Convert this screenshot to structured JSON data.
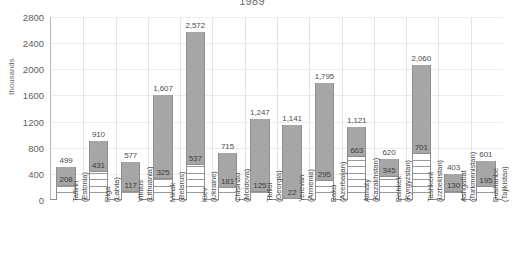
{
  "chart_data": {
    "type": "bar",
    "title": "1989",
    "xlabel": "",
    "ylabel": "thousands",
    "ylim": [
      0,
      2800
    ],
    "ytick_step": 400,
    "yticks": [
      0,
      400,
      800,
      1200,
      1600,
      2000,
      2400,
      2800
    ],
    "grid": true,
    "legend": "none",
    "bar_color": "#a6a6a6",
    "categories": [
      "Tallinn (Estonia)",
      "Riga (Latvia)",
      "Vilnius (Lithuania)",
      "Minsk (Belarus)",
      "Kiev (Ukraine)",
      "Chișinău (Moldova)",
      "Tbilisi (Georgia)",
      "Yerevan (Armenia)",
      "Baku (Azerbaijan)",
      "Almaty (Kazakhstan)",
      "Bishkek (Kyrgyzstan)",
      "Tashkent (Uzbekistan)",
      "Ashgabat (Turkmenistan)",
      "Dushanbe (Tajikistan)"
    ],
    "cities": [
      "Tallinn",
      "Riga",
      "Vilnius",
      "Minsk",
      "Kiev",
      "Chișinău",
      "Tbilisi",
      "Yerevan",
      "Baku",
      "Almaty",
      "Bishkek",
      "Tashkent",
      "Ashgabat",
      "Dushanbe"
    ],
    "countries": [
      "(Estonia)",
      "(Latvia)",
      "(Lithuania)",
      "(Belarus)",
      "(Ukraine)",
      "(Moldova)",
      "(Georgia)",
      "(Armenia)",
      "(Azerbaijan)",
      "(Kazakhstan)",
      "(Kyrgyzstan)",
      "(Uzbekistan)",
      "(Turkmenistan)",
      "(Tajikistan)"
    ],
    "series": [
      {
        "name": "total",
        "values": [
          499,
          910,
          577,
          1607,
          2572,
          715,
          1247,
          1141,
          1795,
          1121,
          620,
          2060,
          403,
          601
        ],
        "labels": [
          "499",
          "910",
          "577",
          "1,607",
          "2,572",
          "715",
          "1,247",
          "1,141",
          "1,795",
          "1,121",
          "620",
          "2,060",
          "403",
          "601"
        ]
      },
      {
        "name": "inner",
        "values": [
          208,
          431,
          117,
          325,
          537,
          181,
          125,
          22,
          295,
          663,
          345,
          701,
          130,
          195
        ],
        "labels": [
          "208",
          "431",
          "117",
          "325",
          "537",
          "181",
          "125",
          "22",
          "295",
          "663",
          "345",
          "701",
          "130",
          "195"
        ]
      }
    ]
  }
}
